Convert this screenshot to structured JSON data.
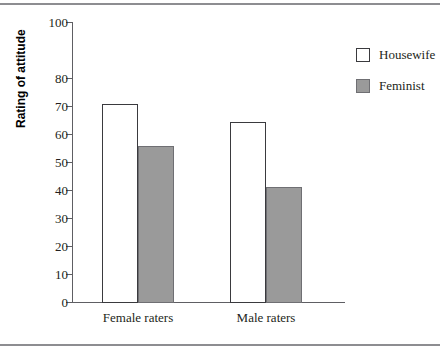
{
  "chart_data": {
    "type": "bar",
    "title": "",
    "xlabel": "",
    "ylabel": "Rating of attitude",
    "categories": [
      "Female raters",
      "Male raters"
    ],
    "series": [
      {
        "name": "Housewife",
        "values": [
          71,
          64.5
        ],
        "color": "#ffffff"
      },
      {
        "name": "Feminist",
        "values": [
          56,
          41.5
        ],
        "color": "#9a9a9a"
      }
    ],
    "ylim": [
      0,
      100
    ],
    "ytick_labels": [
      "0",
      "10",
      "20",
      "30",
      "40",
      "50",
      "60",
      "70",
      "80",
      "100"
    ],
    "ytick_values": [
      0,
      10,
      20,
      30,
      40,
      50,
      60,
      70,
      80,
      100
    ],
    "grid": false,
    "legend_position": "right",
    "note_axis": "tick for 90 is not drawn; spacing from 80 to 100 is double"
  },
  "axis": {
    "y_title": "Rating of attitude",
    "ticks": [
      {
        "label": "100",
        "y": 0
      },
      {
        "label": "80",
        "y": 56
      },
      {
        "label": "70",
        "y": 84
      },
      {
        "label": "60",
        "y": 112
      },
      {
        "label": "50",
        "y": 140
      },
      {
        "label": "40",
        "y": 168
      },
      {
        "label": "30",
        "y": 196
      },
      {
        "label": "20",
        "y": 224
      },
      {
        "label": "10",
        "y": 252
      },
      {
        "label": "0",
        "y": 280
      }
    ]
  },
  "bars": [
    {
      "group": "Female raters",
      "series": "Housewife",
      "value": 71,
      "left": 30,
      "width": 36,
      "height": 198.8
    },
    {
      "group": "Female raters",
      "series": "Feminist",
      "value": 56,
      "left": 66,
      "width": 36,
      "height": 156.8
    },
    {
      "group": "Male raters",
      "series": "Housewife",
      "value": 64.5,
      "left": 158,
      "width": 36,
      "height": 180.6
    },
    {
      "group": "Male raters",
      "series": "Feminist",
      "value": 41.5,
      "left": 194,
      "width": 36,
      "height": 116.2
    }
  ],
  "category_labels": [
    {
      "text": "Female raters",
      "x": 66
    },
    {
      "text": "Male raters",
      "x": 194
    }
  ],
  "legend": {
    "items": [
      {
        "label": "Housewife",
        "swatch": "housewife"
      },
      {
        "label": "Feminist",
        "swatch": "feminist"
      }
    ]
  }
}
